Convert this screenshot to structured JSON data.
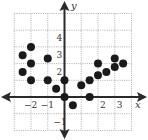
{
  "chart_data": {
    "type": "scatter",
    "title": "",
    "xlabel": "x",
    "ylabel": "y",
    "xlim": [
      -3,
      4
    ],
    "ylim": [
      -2,
      5
    ],
    "grid": true,
    "grid_style": "dotted",
    "x_ticks": [
      {
        "value": -2,
        "label": "−2"
      },
      {
        "value": -1,
        "label": "−1"
      },
      {
        "value": 2,
        "label": "2"
      },
      {
        "value": 3,
        "label": "3"
      }
    ],
    "y_ticks": [
      {
        "value": 4,
        "label": "4"
      },
      {
        "value": 3,
        "label": "3"
      },
      {
        "value": 2,
        "label": "2"
      },
      {
        "value": -1,
        "label": "−1"
      }
    ],
    "series": [
      {
        "name": "points",
        "color": "#1a1a1a",
        "points": [
          {
            "x": -2.5,
            "y": 2.5
          },
          {
            "x": -2.5,
            "y": 1.5
          },
          {
            "x": -2,
            "y": 3
          },
          {
            "x": -2,
            "y": 2
          },
          {
            "x": -2,
            "y": 1
          },
          {
            "x": -1,
            "y": 2.3
          },
          {
            "x": -1,
            "y": 1
          },
          {
            "x": -0.5,
            "y": 0.5
          },
          {
            "x": 0,
            "y": 1
          },
          {
            "x": 0,
            "y": 0
          },
          {
            "x": 0.5,
            "y": -0.5
          },
          {
            "x": 1,
            "y": 0.7
          },
          {
            "x": 1.5,
            "y": 0
          },
          {
            "x": 1.5,
            "y": 1
          },
          {
            "x": 2,
            "y": 1.3
          },
          {
            "x": 2,
            "y": 2
          },
          {
            "x": 2.5,
            "y": 1.5
          },
          {
            "x": 3,
            "y": 1.8
          },
          {
            "x": 3,
            "y": 2.3
          },
          {
            "x": 3.5,
            "y": 2
          }
        ]
      }
    ],
    "legend": null
  }
}
